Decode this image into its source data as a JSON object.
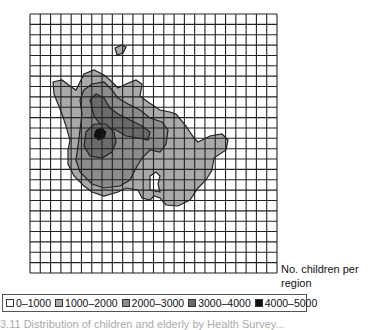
{
  "figure": {
    "label_right": "No. children per region",
    "label_line1": "No. children per",
    "label_line2": "region",
    "grid": {
      "cols": 24,
      "rows": 25,
      "left": 30,
      "top": 14,
      "right": 277,
      "bottom": 273
    },
    "caption_partial": "3.11  Distribution of children and elderly by Health Survey..."
  },
  "legend": {
    "items": [
      {
        "label": "0–1000",
        "color": "#ffffff"
      },
      {
        "label": "1000–2000",
        "color": "#a9a9a9"
      },
      {
        "label": "2000–3000",
        "color": "#8c8c8c"
      },
      {
        "label": "3000–4000",
        "color": "#6b6b6b"
      },
      {
        "label": "4000–5000",
        "color": "#111111"
      }
    ]
  }
}
